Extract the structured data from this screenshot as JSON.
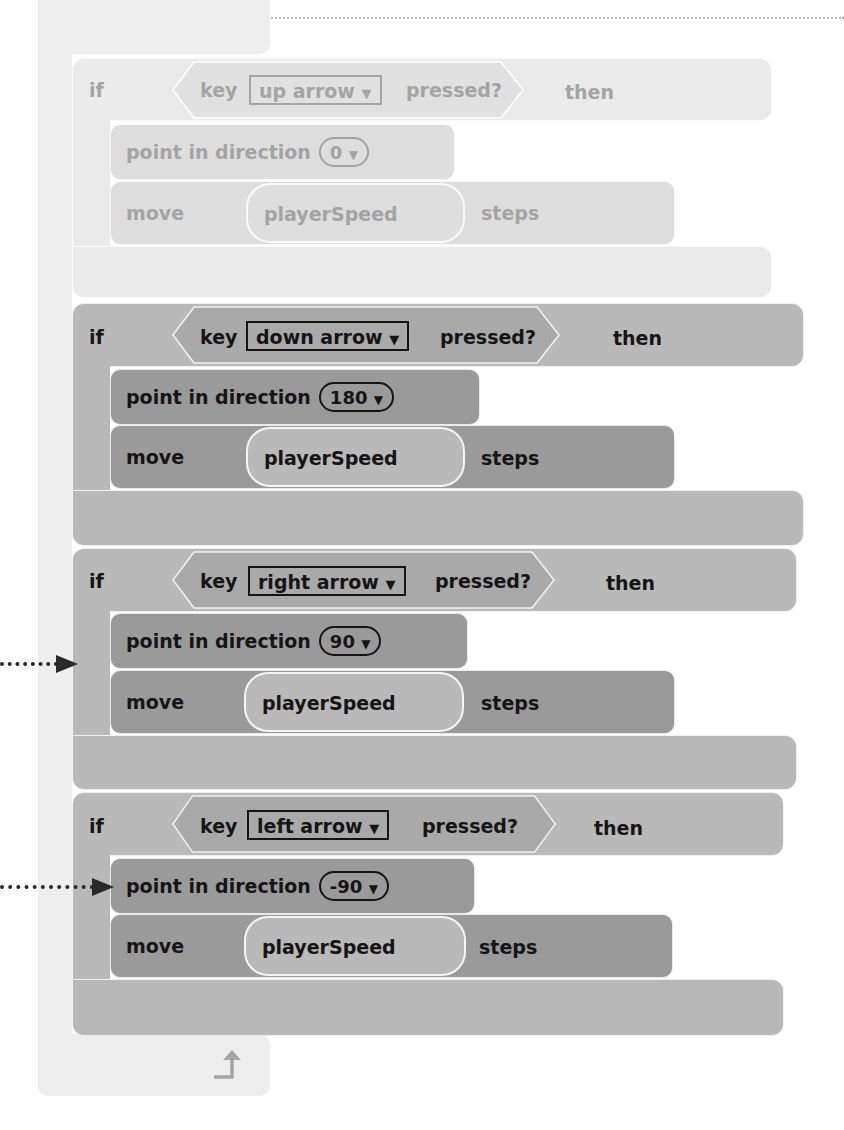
{
  "forever_block": {
    "loop_icon": "loop-arrow-icon"
  },
  "if_blocks": [
    {
      "if_label": "if",
      "key_label": "key",
      "key_value": "up arrow",
      "pressed_label": "pressed?",
      "then_label": "then",
      "point_label": "point in direction",
      "direction_value": "0",
      "move_label": "move",
      "move_variable": "playerSpeed",
      "steps_label": "steps",
      "faded": true
    },
    {
      "if_label": "if",
      "key_label": "key",
      "key_value": "down arrow",
      "pressed_label": "pressed?",
      "then_label": "then",
      "point_label": "point in direction",
      "direction_value": "180",
      "move_label": "move",
      "move_variable": "playerSpeed",
      "steps_label": "steps",
      "faded": false
    },
    {
      "if_label": "if",
      "key_label": "key",
      "key_value": "right arrow",
      "pressed_label": "pressed?",
      "then_label": "then",
      "point_label": "point in direction",
      "direction_value": "90",
      "move_label": "move",
      "move_variable": "playerSpeed",
      "steps_label": "steps",
      "faded": false
    },
    {
      "if_label": "if",
      "key_label": "key",
      "key_value": "left arrow",
      "pressed_label": "pressed?",
      "then_label": "then",
      "point_label": "point in direction",
      "direction_value": "-90",
      "move_label": "move",
      "move_variable": "playerSpeed",
      "steps_label": "steps",
      "faded": false
    }
  ],
  "dropdown_glyph": "▼",
  "annotations": [
    {
      "type": "callout-arrow",
      "target": "if-block-right-arrow"
    },
    {
      "type": "callout-arrow",
      "target": "point-in-direction-minus-90"
    }
  ],
  "colors": {
    "faded_outer": "#ebebeb",
    "faded_inner": "#dedede",
    "strong_outer": "#b9b9b9",
    "strong_inner": "#9a9a9a",
    "text_dark": "#151515",
    "text_faded": "#a4a4a4"
  }
}
